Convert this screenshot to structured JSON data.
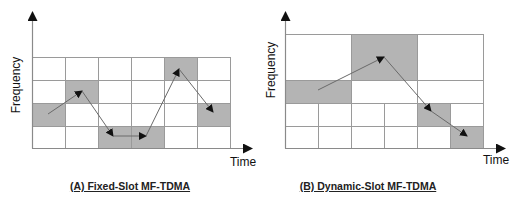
{
  "colors": {
    "shaded": "#b4b4b4",
    "empty": "#ffffff",
    "grid_line": "#9a9a9a",
    "axis": "#8a8a8a",
    "arrow": "#111111"
  },
  "diagrams": [
    {
      "id": "A",
      "caption": "(A) Fixed-Slot MF-TDMA",
      "y_label": "Frequency",
      "x_label": "Time",
      "grid": {
        "columns": 6,
        "rows": 4
      },
      "cells": [
        {
          "x": 32,
          "y": 57,
          "w": 33,
          "h": 23,
          "shaded": false
        },
        {
          "x": 65,
          "y": 57,
          "w": 33,
          "h": 23,
          "shaded": false
        },
        {
          "x": 98,
          "y": 57,
          "w": 33,
          "h": 23,
          "shaded": false
        },
        {
          "x": 131,
          "y": 57,
          "w": 33,
          "h": 23,
          "shaded": false
        },
        {
          "x": 164,
          "y": 57,
          "w": 33,
          "h": 23,
          "shaded": true
        },
        {
          "x": 197,
          "y": 57,
          "w": 33,
          "h": 23,
          "shaded": false
        },
        {
          "x": 32,
          "y": 80,
          "w": 33,
          "h": 23,
          "shaded": false
        },
        {
          "x": 65,
          "y": 80,
          "w": 33,
          "h": 23,
          "shaded": true
        },
        {
          "x": 98,
          "y": 80,
          "w": 33,
          "h": 23,
          "shaded": false
        },
        {
          "x": 131,
          "y": 80,
          "w": 33,
          "h": 23,
          "shaded": false
        },
        {
          "x": 164,
          "y": 80,
          "w": 33,
          "h": 23,
          "shaded": false
        },
        {
          "x": 197,
          "y": 80,
          "w": 33,
          "h": 23,
          "shaded": false
        },
        {
          "x": 32,
          "y": 103,
          "w": 33,
          "h": 23,
          "shaded": true
        },
        {
          "x": 65,
          "y": 103,
          "w": 33,
          "h": 23,
          "shaded": false
        },
        {
          "x": 98,
          "y": 103,
          "w": 33,
          "h": 23,
          "shaded": false
        },
        {
          "x": 131,
          "y": 103,
          "w": 33,
          "h": 23,
          "shaded": false
        },
        {
          "x": 164,
          "y": 103,
          "w": 33,
          "h": 23,
          "shaded": false
        },
        {
          "x": 197,
          "y": 103,
          "w": 33,
          "h": 23,
          "shaded": true
        },
        {
          "x": 32,
          "y": 126,
          "w": 33,
          "h": 22,
          "shaded": false
        },
        {
          "x": 65,
          "y": 126,
          "w": 33,
          "h": 22,
          "shaded": false
        },
        {
          "x": 98,
          "y": 126,
          "w": 33,
          "h": 22,
          "shaded": true
        },
        {
          "x": 131,
          "y": 126,
          "w": 33,
          "h": 22,
          "shaded": true
        },
        {
          "x": 164,
          "y": 126,
          "w": 33,
          "h": 22,
          "shaded": false
        },
        {
          "x": 197,
          "y": 126,
          "w": 33,
          "h": 22,
          "shaded": false
        }
      ],
      "hop_path": [
        [
          48,
          114
        ],
        [
          82,
          91
        ],
        [
          113,
          136
        ],
        [
          146,
          136
        ],
        [
          179,
          69
        ],
        [
          213,
          112
        ]
      ],
      "axes": {
        "origin": [
          32,
          148
        ],
        "y_top": 12,
        "x_right": 252
      },
      "y_label_pos": [
        20,
        85
      ],
      "x_label_pos": [
        243,
        166
      ],
      "caption_center_x": 130
    },
    {
      "id": "B",
      "caption": "(B) Dynamic-Slot MF-TDMA",
      "y_label": "Frequency",
      "x_label": "Time",
      "grid": {
        "columns": 6,
        "rows": 4
      },
      "cells": [
        {
          "x": 285,
          "y": 34,
          "w": 66,
          "h": 46,
          "shaded": false
        },
        {
          "x": 351,
          "y": 34,
          "w": 66,
          "h": 46,
          "shaded": true
        },
        {
          "x": 417,
          "y": 34,
          "w": 66,
          "h": 46,
          "shaded": false
        },
        {
          "x": 285,
          "y": 80,
          "w": 66,
          "h": 23,
          "shaded": true
        },
        {
          "x": 351,
          "y": 80,
          "w": 66,
          "h": 23,
          "shaded": false
        },
        {
          "x": 417,
          "y": 80,
          "w": 66,
          "h": 23,
          "shaded": false
        },
        {
          "x": 285,
          "y": 103,
          "w": 33,
          "h": 23,
          "shaded": false
        },
        {
          "x": 318,
          "y": 103,
          "w": 33,
          "h": 23,
          "shaded": false
        },
        {
          "x": 351,
          "y": 103,
          "w": 33,
          "h": 23,
          "shaded": false
        },
        {
          "x": 384,
          "y": 103,
          "w": 33,
          "h": 23,
          "shaded": false
        },
        {
          "x": 417,
          "y": 103,
          "w": 33,
          "h": 23,
          "shaded": true
        },
        {
          "x": 450,
          "y": 103,
          "w": 33,
          "h": 23,
          "shaded": false
        },
        {
          "x": 285,
          "y": 126,
          "w": 33,
          "h": 22,
          "shaded": false
        },
        {
          "x": 318,
          "y": 126,
          "w": 33,
          "h": 22,
          "shaded": false
        },
        {
          "x": 351,
          "y": 126,
          "w": 33,
          "h": 22,
          "shaded": false
        },
        {
          "x": 384,
          "y": 126,
          "w": 33,
          "h": 22,
          "shaded": false
        },
        {
          "x": 417,
          "y": 126,
          "w": 33,
          "h": 22,
          "shaded": false
        },
        {
          "x": 450,
          "y": 126,
          "w": 33,
          "h": 22,
          "shaded": true
        }
      ],
      "hop_path": [
        [
          318,
          90
        ],
        [
          384,
          57
        ],
        [
          431,
          111
        ],
        [
          467,
          136
        ]
      ],
      "axes": {
        "origin": [
          285,
          148
        ],
        "y_top": 12,
        "x_right": 505
      },
      "y_label_pos": [
        275,
        70
      ],
      "x_label_pos": [
        496,
        164
      ],
      "caption_center_x": 368
    }
  ]
}
